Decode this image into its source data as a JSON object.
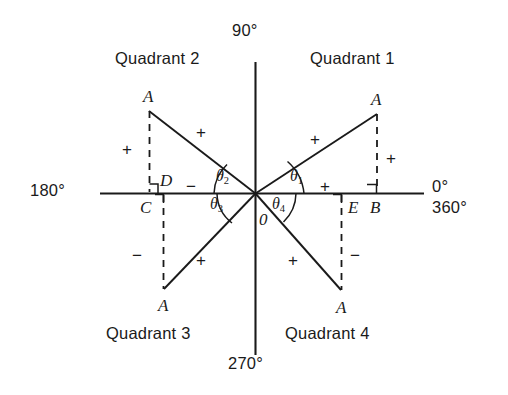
{
  "figure": {
    "type": "trigonometric-quadrant-diagram",
    "width": 508,
    "height": 395,
    "line_color": "#1a1a1a",
    "background_color": "#ffffff"
  },
  "axis_labels": {
    "top": "90°",
    "left": "180°",
    "right_upper": "0°",
    "right_lower": "360°",
    "bottom": "270°"
  },
  "quadrants": [
    {
      "id": "q1",
      "label": "Quadrant 1"
    },
    {
      "id": "q2",
      "label": "Quadrant 2"
    },
    {
      "id": "q3",
      "label": "Quadrant 3"
    },
    {
      "id": "q4",
      "label": "Quadrant 4"
    }
  ],
  "vertex_labels": {
    "a_q1": "A",
    "a_q2": "A",
    "a_q3": "A",
    "a_q4": "A",
    "origin": "0",
    "foot_b": "B",
    "foot_c": "C",
    "foot_d": "D",
    "foot_e": "E"
  },
  "angles": [
    {
      "id": "theta1",
      "name": "θ",
      "sub": "1",
      "quadrant": "Quadrant 1"
    },
    {
      "id": "theta2",
      "name": "θ",
      "sub": "2",
      "quadrant": "Quadrant 2"
    },
    {
      "id": "theta3",
      "name": "θ",
      "sub": "3",
      "quadrant": "Quadrant 3"
    },
    {
      "id": "theta4",
      "name": "θ",
      "sub": "4",
      "quadrant": "Quadrant 4"
    }
  ],
  "signs": {
    "q1_hypotenuse": "+",
    "q1_vertical": "+",
    "q1_horizontal": "+",
    "q2_hypotenuse": "+",
    "q2_vertical": "+",
    "q2_horizontal": "−",
    "q3_hypotenuse": "+",
    "q3_vertical": "−",
    "q4_hypotenuse": "+",
    "q4_vertical": "−"
  }
}
